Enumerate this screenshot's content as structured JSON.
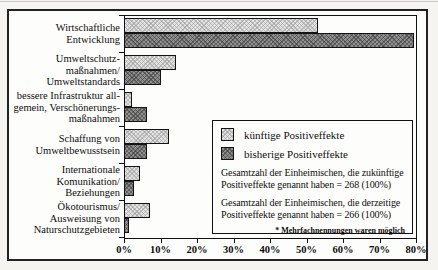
{
  "page": {
    "background": "#f5f4f1"
  },
  "chart_data": {
    "type": "bar",
    "orientation": "horizontal",
    "title": "",
    "xlabel": "",
    "ylabel": "",
    "grid": false,
    "xlim": [
      0,
      80
    ],
    "x_ticks": [
      "0%",
      "10%",
      "20%",
      "30%",
      "40%",
      "50%",
      "60%",
      "70%",
      "80%"
    ],
    "categories": [
      "Wirtschaftliche Entwicklung",
      "Umweltschutzmaßnahmen/Umweltstandards",
      "bessere Infrastruktur allgemein, Verschönerungsmaßnahmen",
      "Schaffung von Umweltbewusstsein",
      "Internationale Komunikation/Beziehungen",
      "Ökotourismus/Ausweisung von Naturschutzgebieten"
    ],
    "category_lines": [
      [
        "Wirtschaftliche",
        "Entwicklung"
      ],
      [
        "Umweltschutz-",
        "maßnahmen/",
        "Umweltstandards"
      ],
      [
        "bessere Infrastruktur all-",
        "gemein, Verschönerungs-",
        "maßnahmen"
      ],
      [
        "Schaffung von",
        "Umweltbewusstsein"
      ],
      [
        "Internationale",
        "Komunikation/",
        "Beziehungen"
      ],
      [
        "Ökotourismus/",
        "Ausweisung von",
        "Naturschutzgebieten"
      ]
    ],
    "series": [
      {
        "name": "künftige Positiveffekte",
        "color": "#e2e2e2",
        "pattern": "light-crosshatch",
        "values": [
          53,
          14,
          2,
          12,
          4,
          7
        ]
      },
      {
        "name": "bisherige Positiveffekte",
        "color": "#8f8f8f",
        "pattern": "dark-crosshatch",
        "values": [
          79.5,
          10,
          6,
          6,
          2.5,
          0.5
        ]
      }
    ],
    "legend_position": "inside-right"
  },
  "legend": {
    "items": [
      {
        "label": "künftige Positiveffekte"
      },
      {
        "label": "bisherige Positiveffekte"
      }
    ],
    "notes": [
      "Gesamtzahl der Einheimischen, die zukünftige Positiveffekte genannt haben = 268 (100%)",
      "Gesamtzahl der Einheimischen, die derzeitige Positiveffekte genannt haben = 266 (100%)"
    ],
    "footnote": "* Mehrfachnennungen waren möglich"
  }
}
